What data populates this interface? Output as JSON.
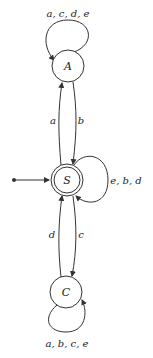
{
  "diagram": {
    "type": "finite-state-automaton",
    "states": [
      {
        "id": "A",
        "label": "A",
        "accepting": false,
        "initial": false
      },
      {
        "id": "S",
        "label": "S",
        "accepting": true,
        "initial": true
      },
      {
        "id": "C",
        "label": "C",
        "accepting": false,
        "initial": false
      }
    ],
    "transitions": [
      {
        "from": "A",
        "to": "A",
        "label": "a, c, d, e"
      },
      {
        "from": "S",
        "to": "A",
        "label": "a"
      },
      {
        "from": "A",
        "to": "S",
        "label": "b"
      },
      {
        "from": "S",
        "to": "S",
        "label": "e, b, d"
      },
      {
        "from": "C",
        "to": "S",
        "label": "d"
      },
      {
        "from": "S",
        "to": "C",
        "label": "c"
      },
      {
        "from": "C",
        "to": "C",
        "label": "a, b, c, e"
      }
    ],
    "colors": {
      "stroke": "#333333",
      "background": "#ffffff",
      "text": "#222222"
    }
  }
}
